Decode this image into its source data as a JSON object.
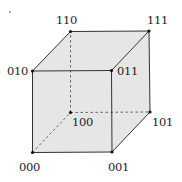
{
  "diagram": {
    "style": {
      "face_fill": "#e6e6e6",
      "edge_color": "#333333",
      "hidden_edge_color": "#555555",
      "vertex_color": "#111111",
      "label_color": "#222222"
    },
    "stray_mark": {
      "x": 10,
      "y": 12
    },
    "vertices": [
      {
        "id": "000",
        "label": "000",
        "x": 32.5,
        "y": 152.5,
        "label_x": 19,
        "label_y": 161
      },
      {
        "id": "001",
        "label": "001",
        "x": 112,
        "y": 152,
        "label_x": 108,
        "label_y": 161
      },
      {
        "id": "010",
        "label": "010",
        "x": 32.5,
        "y": 71,
        "label_x": 7,
        "label_y": 65
      },
      {
        "id": "011",
        "label": "011",
        "x": 111.5,
        "y": 70.5,
        "label_x": 117,
        "label_y": 65
      },
      {
        "id": "100",
        "label": "100",
        "x": 70.5,
        "y": 112.5,
        "label_x": 72,
        "label_y": 116
      },
      {
        "id": "101",
        "label": "101",
        "x": 150,
        "y": 112,
        "label_x": 152,
        "label_y": 116
      },
      {
        "id": "110",
        "label": "110",
        "x": 70.5,
        "y": 31.5,
        "label_x": 56,
        "label_y": 14
      },
      {
        "id": "111",
        "label": "111",
        "x": 149,
        "y": 31,
        "label_x": 147,
        "label_y": 14
      }
    ],
    "visible_edges": [
      [
        "000",
        "001"
      ],
      [
        "000",
        "010"
      ],
      [
        "001",
        "011"
      ],
      [
        "010",
        "011"
      ],
      [
        "010",
        "110"
      ],
      [
        "011",
        "111"
      ],
      [
        "110",
        "111"
      ],
      [
        "001",
        "101"
      ],
      [
        "101",
        "111"
      ]
    ],
    "hidden_edges": [
      [
        "000",
        "100"
      ],
      [
        "100",
        "101"
      ],
      [
        "100",
        "110"
      ]
    ],
    "faces": [
      [
        "000",
        "001",
        "011",
        "010"
      ],
      [
        "010",
        "011",
        "111",
        "110"
      ],
      [
        "001",
        "101",
        "111",
        "011"
      ]
    ]
  }
}
